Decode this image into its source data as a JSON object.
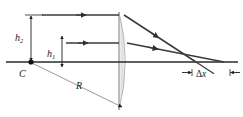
{
  "figure": {
    "width": 243,
    "height": 117,
    "background_color": "#ffffff",
    "ink_color": "#1a1a1a",
    "lens_fill_light": "#f4f4f4",
    "lens_fill_mid": "#d8d8d8",
    "lens_edge_color": "#8f8f8f",
    "axis_color": "#2a2a2a",
    "ray_color": "#3a3a3a",
    "radius_line_color": "#7a7a7a"
  },
  "labels": {
    "height_outer": {
      "base": "h",
      "sub": "2",
      "full": "h2"
    },
    "height_inner": {
      "base": "h",
      "sub": "1",
      "full": "h1"
    },
    "center_of_curvature": "C",
    "radius": "R",
    "aberration": {
      "delta": "Δ",
      "base": "x",
      "full": "Δx"
    }
  },
  "geometry": {
    "axis_y": 62,
    "axis_x_start": 6,
    "axis_x_end": 238,
    "ray_outer_y": 15,
    "ray_inner_y": 43,
    "ray_x_start": 42,
    "lens_front_x": 119,
    "lens_back_x": 128,
    "lens_top_y": 12,
    "lens_bottom_y": 110,
    "focus_outer_x": 196,
    "focus_inner_x": 224,
    "center_point_x": 31,
    "center_point_y": 62,
    "dim_h2_x": 31,
    "dim_h1_x": 62,
    "delta_x_span": [
      196,
      224
    ],
    "delta_x_dim_y": 72
  },
  "annotations": {
    "ray_arrow_positions_incoming": [
      80,
      88
    ],
    "ray_arrow_positions_refracted": [
      2,
      2
    ],
    "radius_endpoint_x": 123,
    "radius_endpoint_y": 108
  }
}
